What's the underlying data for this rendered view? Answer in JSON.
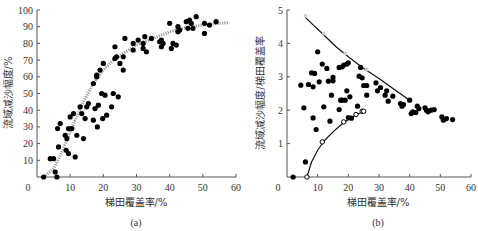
{
  "chart_data": [
    {
      "type": "scatter",
      "caption": "(a)",
      "xlabel": "梯田覆盖率/%",
      "ylabel": "流域减沙幅度/%",
      "xlim": [
        0,
        60
      ],
      "ylim": [
        0,
        100
      ],
      "xticks": [
        0,
        10,
        20,
        30,
        40,
        50,
        60
      ],
      "yticks": [
        0,
        10,
        20,
        30,
        40,
        50,
        60,
        70,
        80,
        90,
        100
      ],
      "grid": false,
      "series": [
        {
          "name": "observed",
          "marker": "filled-circle",
          "points": [
            [
              2,
              0
            ],
            [
              4,
              11
            ],
            [
              5,
              11
            ],
            [
              5.5,
              3
            ],
            [
              6,
              0
            ],
            [
              6.2,
              29
            ],
            [
              6.5,
              18
            ],
            [
              7,
              32
            ],
            [
              8.5,
              25
            ],
            [
              8.8,
              16
            ],
            [
              9,
              23
            ],
            [
              9.5,
              14
            ],
            [
              9.5,
              29
            ],
            [
              10,
              36
            ],
            [
              10.5,
              29
            ],
            [
              11,
              38
            ],
            [
              11.5,
              12
            ],
            [
              12,
              25
            ],
            [
              13,
              42
            ],
            [
              13.5,
              38
            ],
            [
              14,
              23
            ],
            [
              14.5,
              35
            ],
            [
              15,
              42
            ],
            [
              15.5,
              44
            ],
            [
              17,
              34
            ],
            [
              17,
              56
            ],
            [
              17.5,
              41
            ],
            [
              18,
              60
            ],
            [
              18,
              61
            ],
            [
              18.2,
              30
            ],
            [
              18.5,
              43
            ],
            [
              19,
              64
            ],
            [
              19.5,
              50
            ],
            [
              19.8,
              35
            ],
            [
              20,
              68
            ],
            [
              20.5,
              49
            ],
            [
              21,
              37
            ],
            [
              22.5,
              42
            ],
            [
              23,
              50
            ],
            [
              23.5,
              71
            ],
            [
              23.5,
              78
            ],
            [
              24,
              72
            ],
            [
              24.5,
              48
            ],
            [
              25,
              68
            ],
            [
              26,
              64
            ],
            [
              26,
              72
            ],
            [
              26.5,
              83
            ],
            [
              29,
              80
            ],
            [
              29,
              76
            ],
            [
              30.5,
              82
            ],
            [
              32,
              80
            ],
            [
              32,
              77
            ],
            [
              32.5,
              84
            ],
            [
              33,
              75
            ],
            [
              34.5,
              83
            ],
            [
              37,
              81
            ],
            [
              37.5,
              82
            ],
            [
              37.5,
              78
            ],
            [
              38,
              80
            ],
            [
              40,
              92
            ],
            [
              40.5,
              77
            ],
            [
              41,
              80
            ],
            [
              42,
              79
            ],
            [
              42.5,
              90
            ],
            [
              42.5,
              87
            ],
            [
              43,
              88
            ],
            [
              45,
              93
            ],
            [
              45.5,
              89
            ],
            [
              46,
              94
            ],
            [
              46.5,
              92
            ],
            [
              47,
              89
            ],
            [
              48,
              96
            ],
            [
              50.5,
              92
            ],
            [
              50.5,
              86
            ],
            [
              52,
              91
            ],
            [
              54,
              93
            ]
          ]
        },
        {
          "name": "fitted curve",
          "style": "dotted grey",
          "points": [
            [
              2,
              0
            ],
            [
              5,
              5
            ],
            [
              8,
              17
            ],
            [
              11,
              32
            ],
            [
              14,
              45
            ],
            [
              17,
              56
            ],
            [
              20,
              64
            ],
            [
              23,
              70
            ],
            [
              26,
              74
            ],
            [
              30,
              79
            ],
            [
              35,
              83
            ],
            [
              40,
              87
            ],
            [
              45,
              89.5
            ],
            [
              50,
              91
            ],
            [
              55,
              92
            ],
            [
              58,
              92.5
            ]
          ]
        }
      ]
    },
    {
      "type": "scatter",
      "caption": "(b)",
      "xlabel": "梯田覆盖率/%",
      "ylabel": "流域减沙幅度/梯田覆盖率",
      "xlim": [
        0,
        60
      ],
      "ylim": [
        0,
        5
      ],
      "xticks": [
        0,
        10,
        20,
        30,
        40,
        50,
        60
      ],
      "yticks": [
        0,
        1,
        2,
        3,
        4,
        5
      ],
      "grid": false,
      "series": [
        {
          "name": "observed",
          "marker": "filled-circle",
          "points": [
            [
              2,
              0
            ],
            [
              4.5,
              2.75
            ],
            [
              5.5,
              2.07
            ],
            [
              6,
              0.45
            ],
            [
              7,
              2.77
            ],
            [
              8,
              3.12
            ],
            [
              8.5,
              1.77
            ],
            [
              8.5,
              2.7
            ],
            [
              9,
              3.1
            ],
            [
              9.5,
              1.42
            ],
            [
              10,
              3.75
            ],
            [
              10.5,
              2.85
            ],
            [
              11.5,
              3.38
            ],
            [
              12,
              2.1
            ],
            [
              13,
              3.25
            ],
            [
              13.5,
              2.87
            ],
            [
              14,
              1.67
            ],
            [
              14.5,
              2.45
            ],
            [
              15,
              2.88
            ],
            [
              15,
              2.98
            ],
            [
              17,
              2.02
            ],
            [
              17,
              3.28
            ],
            [
              17.5,
              2.3
            ],
            [
              18,
              3.3
            ],
            [
              18,
              2.3
            ],
            [
              18.5,
              3.35
            ],
            [
              19,
              2.3
            ],
            [
              19.5,
              2.58
            ],
            [
              19.5,
              3.38
            ],
            [
              20,
              1.78
            ],
            [
              20,
              3.42
            ],
            [
              20.5,
              2.4
            ],
            [
              21,
              1.76
            ],
            [
              23,
              2.12
            ],
            [
              23.5,
              3.02
            ],
            [
              24,
              3.28
            ],
            [
              24.5,
              2.97
            ],
            [
              25,
              2.74
            ],
            [
              26,
              2.45
            ],
            [
              26,
              2.74
            ],
            [
              29,
              2.82
            ],
            [
              29.5,
              2.58
            ],
            [
              30.5,
              2.68
            ],
            [
              32,
              2.45
            ],
            [
              32.5,
              2.58
            ],
            [
              33,
              2.27
            ],
            [
              34.5,
              2.42
            ],
            [
              37,
              2.2
            ],
            [
              37.5,
              2.12
            ],
            [
              38,
              2.17
            ],
            [
              40,
              2.3
            ],
            [
              40.5,
              1.9
            ],
            [
              41,
              1.95
            ],
            [
              42,
              1.93
            ],
            [
              42.5,
              2.12
            ],
            [
              43,
              2.05
            ],
            [
              45,
              2.07
            ],
            [
              45.5,
              2.0
            ],
            [
              46,
              1.95
            ],
            [
              47,
              2.0
            ],
            [
              48,
              2.02
            ],
            [
              50.5,
              1.8
            ],
            [
              51,
              1.7
            ],
            [
              52,
              1.75
            ],
            [
              54,
              1.72
            ]
          ]
        },
        {
          "name": "lower bound points",
          "marker": "open-circle",
          "points": [
            [
              6.5,
              0
            ],
            [
              11.5,
              1.05
            ],
            [
              18.5,
              1.65
            ],
            [
              22.5,
              1.87
            ],
            [
              24.5,
              1.97
            ],
            [
              25,
              1.97
            ]
          ]
        },
        {
          "name": "upper envelope",
          "style": "solid line",
          "points": [
            [
              6,
              4.78
            ],
            [
              8,
              4.6
            ],
            [
              12,
              4.25
            ],
            [
              16,
              3.9
            ],
            [
              20,
              3.6
            ],
            [
              25,
              3.25
            ],
            [
              30,
              2.95
            ],
            [
              35,
              2.62
            ],
            [
              40,
              2.3
            ]
          ]
        },
        {
          "name": "lower envelope",
          "style": "solid line",
          "points": [
            [
              6.5,
              0
            ],
            [
              8,
              0.45
            ],
            [
              10,
              0.8
            ],
            [
              12,
              1.07
            ],
            [
              15,
              1.35
            ],
            [
              18.5,
              1.63
            ],
            [
              22,
              1.83
            ],
            [
              25,
              1.97
            ]
          ]
        },
        {
          "name": "upper bound markers",
          "marker": "grey-circle",
          "points": [
            [
              6,
              4.82
            ],
            [
              12,
              4.3
            ],
            [
              19,
              3.7
            ],
            [
              26,
              3.22
            ]
          ]
        }
      ]
    }
  ]
}
